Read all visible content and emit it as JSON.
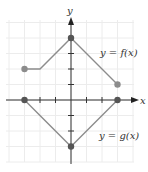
{
  "chart_data": {
    "type": "line",
    "title": "",
    "xlabel": "x",
    "ylabel": "y",
    "xlim": [
      -4,
      4
    ],
    "ylim": [
      -4,
      5
    ],
    "grid": true,
    "tick_spacing": 1,
    "series": [
      {
        "name": "y = f(x)",
        "label": "y = f(x)",
        "points": [
          [
            -3,
            2
          ],
          [
            -2,
            2
          ],
          [
            0,
            4
          ],
          [
            3,
            1
          ]
        ],
        "endpoints": [
          [
            -3,
            2
          ],
          [
            3,
            1
          ]
        ]
      },
      {
        "name": "y = g(x)",
        "label": "y = g(x)",
        "points": [
          [
            -3,
            0
          ],
          [
            0,
            -3
          ],
          [
            3,
            0
          ]
        ],
        "endpoints": [
          [
            -3,
            0
          ],
          [
            3,
            0
          ]
        ]
      }
    ]
  },
  "labels": {
    "x_axis": "x",
    "y_axis": "y",
    "f": "y = f(x)",
    "g": "y = g(x)"
  },
  "colors": {
    "line": "#8c8c8c",
    "axis": "#333333",
    "grid": "#ececec",
    "point": "#8c8c8c",
    "vertex": "#555555"
  }
}
